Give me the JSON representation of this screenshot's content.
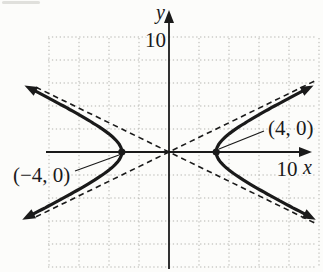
{
  "figure": {
    "background": "#fcfcfa",
    "ink": "#1a1a1a",
    "grid_color": "#b3b3ae"
  },
  "chart_data": {
    "type": "line",
    "subtype": "hyperbola",
    "equation": "x^2/16 - y^2/4 = 1",
    "a": 4,
    "b": 2,
    "center": [
      0,
      0
    ],
    "transverse_axis": "horizontal",
    "vertices": [
      [
        -4,
        0
      ],
      [
        4,
        0
      ]
    ],
    "asymptote_slopes": [
      0.5,
      -0.5
    ],
    "asymptotes": [
      "y = x/2",
      "y = -x/2"
    ],
    "branch_extent_y": 5.45,
    "axes": {
      "xlabel": "x",
      "ylabel": "y",
      "x_tick": {
        "value": 10,
        "label": "10"
      },
      "y_tick": {
        "value": 10,
        "label": "10"
      },
      "x_range": [
        -10,
        10
      ],
      "y_range": [
        -10,
        10
      ]
    },
    "grid": {
      "shown": true,
      "style": "dotted",
      "step": 2
    },
    "annotations": [
      {
        "text": "(−4, 0)",
        "points_to": [
          -4,
          0
        ]
      },
      {
        "text": "(4, 0)",
        "points_to": [
          4,
          0
        ]
      }
    ]
  }
}
